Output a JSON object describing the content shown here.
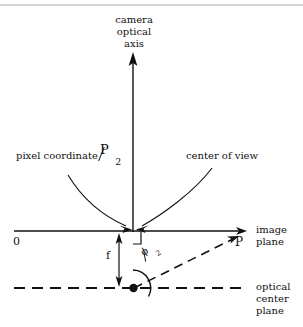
{
  "figure": {
    "title_axis": {
      "line1": "camera",
      "line2": "optical",
      "line3": "axis"
    },
    "annotations": {
      "pixel_coordinate": "pixel coordinate",
      "center_of_view": "center of view",
      "image_plane_line1": "image",
      "image_plane_line2": "plane",
      "optical_center_line1": "optical",
      "optical_center_line2": "center",
      "optical_center_line3": "plane"
    },
    "symbols": {
      "origin": "0",
      "point_p": "P",
      "focal_length": "f",
      "pixel_fraction_num": "P",
      "pixel_fraction_den": "2",
      "angle_num": "ϕ",
      "angle_den": "2"
    },
    "colors": {
      "ink": "#111111",
      "background": "#ffffff",
      "rule": "#9a9a9a"
    }
  }
}
